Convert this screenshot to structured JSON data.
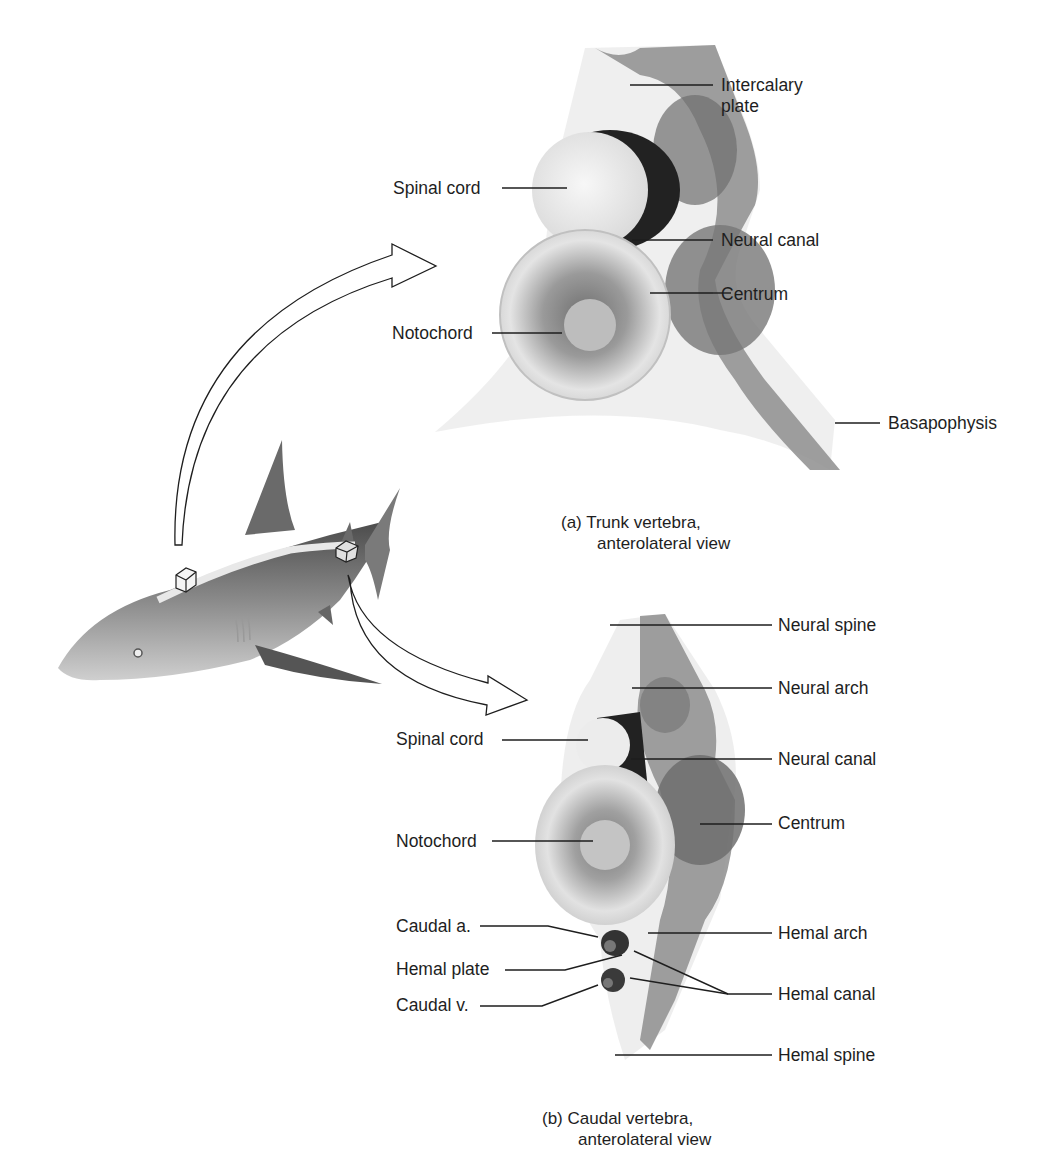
{
  "figure": {
    "panel_a": {
      "caption_line1": "(a) Trunk vertebra,",
      "caption_line2": "anterolateral view",
      "labels": {
        "intercalary_plate_1": "Intercalary",
        "intercalary_plate_2": "plate",
        "spinal_cord": "Spinal cord",
        "neural_canal": "Neural canal",
        "centrum": "Centrum",
        "notochord": "Notochord",
        "basapophysis": "Basapophysis"
      }
    },
    "panel_b": {
      "caption_line1": "(b) Caudal vertebra,",
      "caption_line2": "anterolateral view",
      "labels": {
        "neural_spine": "Neural spine",
        "neural_arch": "Neural arch",
        "spinal_cord": "Spinal cord",
        "neural_canal": "Neural canal",
        "centrum": "Centrum",
        "notochord": "Notochord",
        "caudal_a": "Caudal a.",
        "hemal_plate": "Hemal plate",
        "caudal_v": "Caudal v.",
        "hemal_arch": "Hemal arch",
        "hemal_canal": "Hemal canal",
        "hemal_spine": "Hemal spine"
      }
    },
    "colors": {
      "background": "#ffffff",
      "line": "#1e1e1e",
      "bone_dark": "#8a8a8a",
      "bone_mid": "#b5b5b5",
      "bone_light": "#e6e6e6",
      "shark_body": "#7d7d7d"
    }
  }
}
